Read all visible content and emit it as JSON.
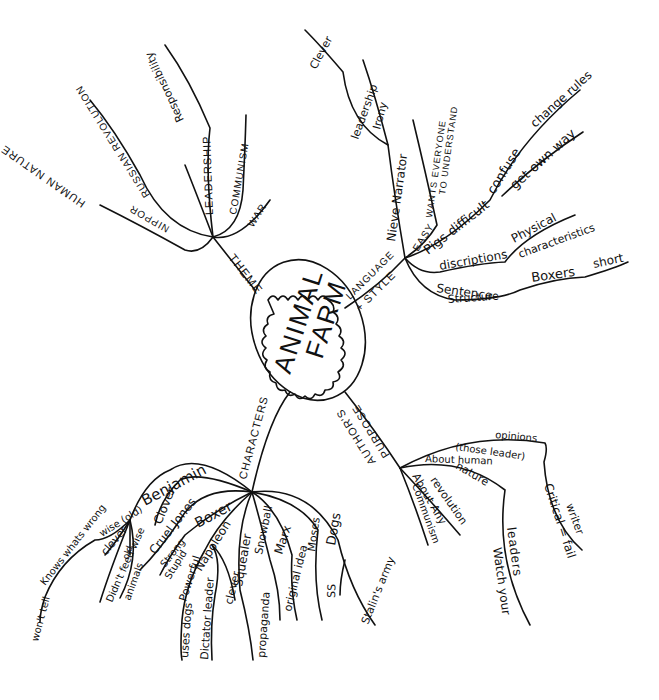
{
  "title": "Animal Farm",
  "center": {
    "line1": "ANIMAL",
    "line2": "FARM"
  },
  "branches": {
    "theme": {
      "label": "THEME",
      "children": [
        {
          "label": "HUMAN NATURE"
        },
        {
          "label": "NIPPOR",
          "sub": "RUSSIAN REVOLUTION"
        },
        {
          "label": "LEADERSHIP",
          "sub": "Responsibility"
        },
        {
          "label": "COMMUNISM"
        },
        {
          "label": "WAR"
        }
      ]
    },
    "language": {
      "label_line1": "LANGUAGE",
      "label_line2": "+ STYLE",
      "children": [
        {
          "label": "Nieve Narrator",
          "subs": [
            "Irony",
            "leadership",
            "Clever"
          ]
        },
        {
          "label": "EASY",
          "sub_line1": "WANTS EVERYONE",
          "sub_line2": "TO UNDERSTAND"
        },
        {
          "label": "Pigs difficult",
          "sub": "confuse",
          "sub2": "change rules",
          "sub3": "get own way"
        },
        {
          "label": "discriptions",
          "sub_line1": "Physical",
          "sub_line2": "characteristics"
        },
        {
          "label_line1": "Sentence",
          "label_line2": "Structure",
          "sub": "Boxers",
          "sub2": "short"
        }
      ]
    },
    "purpose": {
      "label_line1": "PURPOSE",
      "label_line2": "AUTHOR'S",
      "children": [
        {
          "label": "Communism"
        },
        {
          "label": "About Any",
          "sub": "revolution"
        },
        {
          "label": "About human",
          "sub": "nature"
        },
        {
          "label": "Watch your",
          "sub": "leaders"
        },
        {
          "label": "(those leader)",
          "sub": "opinions"
        },
        {
          "label": "Critical = fail",
          "sub": "writer"
        }
      ]
    },
    "characters": {
      "label": "CHARACTERS",
      "children": [
        {
          "label": "Benjamin",
          "sub": "wise (old)",
          "subs": [
            "clever",
            "Knows whats wrong",
            "won't tell",
            "Didn't feed wise",
            "old",
            "animals"
          ]
        },
        {
          "label": "Clover"
        },
        {
          "label": "Cruel Jones"
        },
        {
          "label": "Boxer",
          "subs": [
            "Strong",
            "Stupid"
          ]
        },
        {
          "label": "Napoleon",
          "subs": [
            "Powerful",
            "uses dogs",
            "Dictator leader",
            "clever"
          ]
        },
        {
          "label": "Squealer",
          "subs": [
            "propaganda"
          ]
        },
        {
          "label": "Snowball",
          "subs": [
            "Marx",
            "original idea"
          ]
        },
        {
          "label": "Moses"
        },
        {
          "label": "Dogs",
          "subs": [
            "SS",
            "Stalin's army"
          ]
        }
      ]
    }
  },
  "colors": {
    "ink": "#111111",
    "paper": "#ffffff"
  }
}
